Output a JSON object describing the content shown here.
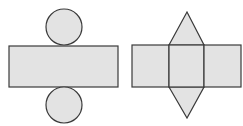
{
  "diagram": {
    "title": "",
    "colors": {
      "fill": "#e3e3e3",
      "stroke": "#3a3a3a",
      "background": "#ffffff"
    },
    "nets": [
      {
        "name": "cylinder-net",
        "parts": [
          {
            "shape": "circle",
            "role": "top-base",
            "cx": 64,
            "cy": 27,
            "r": 18
          },
          {
            "shape": "rectangle",
            "role": "lateral-surface",
            "x": 9,
            "y": 46,
            "w": 109,
            "h": 41
          },
          {
            "shape": "circle",
            "role": "bottom-base",
            "cx": 64,
            "cy": 105,
            "r": 18
          }
        ]
      },
      {
        "name": "triangular-prism-like-net",
        "parts": [
          {
            "shape": "triangle",
            "role": "top-face",
            "points": "169,45 187,12 204,45"
          },
          {
            "shape": "rectangle",
            "role": "left-face",
            "x": 132,
            "y": 45,
            "w": 37,
            "h": 42
          },
          {
            "shape": "rectangle",
            "role": "center-face",
            "x": 169,
            "y": 45,
            "w": 35,
            "h": 42
          },
          {
            "shape": "rectangle",
            "role": "right-face",
            "x": 204,
            "y": 45,
            "w": 37,
            "h": 42
          },
          {
            "shape": "triangle",
            "role": "bottom-face",
            "points": "169,87 187,118 204,87"
          }
        ]
      }
    ]
  }
}
